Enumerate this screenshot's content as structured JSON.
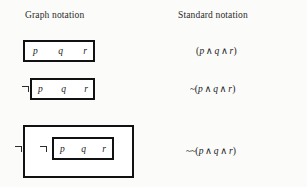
{
  "headers": {
    "graph": "Graph notation",
    "standard": "Standard notation"
  },
  "atoms": {
    "p": "p",
    "q": "q",
    "r": "r"
  },
  "symbols": {
    "hook": "¬",
    "tilde": "~",
    "wedge": "∧",
    "lparen": "(",
    "rparen": ")"
  },
  "rows": [
    {
      "id": "row-1",
      "graph": {
        "nesting": 1,
        "hooks": 0,
        "atoms": [
          "p",
          "q",
          "r"
        ]
      },
      "standard": {
        "negations": "",
        "lparen": "(",
        "v1": "p",
        "op1": "∧",
        "v2": "q",
        "op2": "∧",
        "v3": "r",
        "rparen": ")",
        "full": "(p ∧ q ∧ r)"
      }
    },
    {
      "id": "row-2",
      "graph": {
        "nesting": 1,
        "hooks": 1,
        "atoms": [
          "p",
          "q",
          "r"
        ]
      },
      "standard": {
        "negations": "~",
        "lparen": "(",
        "v1": "p",
        "op1": "∧",
        "v2": "q",
        "op2": "∧",
        "v3": "r",
        "rparen": ")",
        "full": "~(p ∧ q ∧ r)"
      }
    },
    {
      "id": "row-3",
      "graph": {
        "nesting": 2,
        "hooks": 2,
        "atoms": [
          "p",
          "q",
          "r"
        ]
      },
      "standard": {
        "negations": "~~",
        "lparen": "(",
        "v1": "p",
        "op1": "∧",
        "v2": "q",
        "op2": "∧",
        "v3": "r",
        "rparen": ")",
        "full": "~~(p ∧ q ∧ r)"
      }
    }
  ],
  "colors": {
    "background": "#fbfbfa",
    "ink": "#1a1a1a",
    "border": "#111111",
    "box_fill": "#ffffff"
  }
}
